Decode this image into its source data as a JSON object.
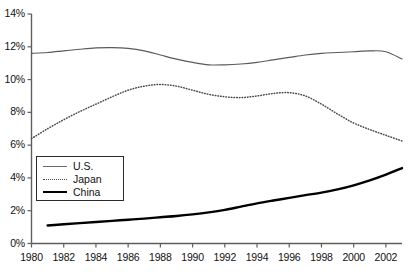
{
  "chart_data": {
    "type": "line",
    "title": "",
    "xlabel": "",
    "ylabel": "",
    "xlim": [
      1980,
      2003
    ],
    "ylim": [
      0,
      14
    ],
    "grid": false,
    "legend_position": "inside-left",
    "y_ticks": [
      "0%",
      "2%",
      "4%",
      "6%",
      "8%",
      "10%",
      "12%",
      "14%"
    ],
    "y_tick_values": [
      0,
      2,
      4,
      6,
      8,
      10,
      12,
      14
    ],
    "x_ticks": [
      "1980",
      "1982",
      "1984",
      "1986",
      "1988",
      "1990",
      "1992",
      "1994",
      "1996",
      "1998",
      "2000",
      "2002"
    ],
    "x_tick_values": [
      1980,
      1982,
      1984,
      1986,
      1988,
      1990,
      1992,
      1994,
      1996,
      1998,
      2000,
      2002
    ],
    "series": [
      {
        "name": "U.S.",
        "style": "solid-thin",
        "color": "#5a5a5a",
        "x": [
          1980,
          1981,
          1982,
          1983,
          1984,
          1985,
          1986,
          1987,
          1988,
          1989,
          1990,
          1991,
          1992,
          1993,
          1994,
          1995,
          1996,
          1997,
          1998,
          1999,
          2000,
          2001,
          2002,
          2003
        ],
        "values": [
          11.6,
          11.65,
          11.75,
          11.85,
          11.93,
          11.95,
          11.9,
          11.75,
          11.5,
          11.25,
          11.05,
          10.9,
          10.9,
          10.95,
          11.05,
          11.2,
          11.35,
          11.5,
          11.6,
          11.65,
          11.7,
          11.75,
          11.7,
          11.25
        ]
      },
      {
        "name": "Japan",
        "style": "dotted",
        "color": "#4a4a4a",
        "x": [
          1980,
          1981,
          1982,
          1983,
          1984,
          1985,
          1986,
          1987,
          1988,
          1989,
          1990,
          1991,
          1992,
          1993,
          1994,
          1995,
          1996,
          1997,
          1998,
          1999,
          2000,
          2001,
          2002,
          2003
        ],
        "values": [
          6.4,
          7.0,
          7.55,
          8.05,
          8.5,
          8.95,
          9.35,
          9.6,
          9.7,
          9.6,
          9.35,
          9.1,
          8.95,
          8.9,
          9.0,
          9.15,
          9.2,
          9.0,
          8.5,
          7.9,
          7.35,
          6.95,
          6.6,
          6.25
        ]
      },
      {
        "name": "China",
        "style": "solid-thick",
        "color": "#000000",
        "x": [
          1981,
          1982,
          1983,
          1984,
          1985,
          1986,
          1987,
          1988,
          1989,
          1990,
          1991,
          1992,
          1993,
          1994,
          1995,
          1996,
          1997,
          1998,
          1999,
          2000,
          2001,
          2002,
          2003
        ],
        "values": [
          1.1,
          1.17,
          1.24,
          1.31,
          1.38,
          1.45,
          1.52,
          1.6,
          1.68,
          1.78,
          1.9,
          2.05,
          2.25,
          2.45,
          2.62,
          2.78,
          2.95,
          3.1,
          3.3,
          3.55,
          3.85,
          4.2,
          4.6
        ]
      }
    ]
  }
}
